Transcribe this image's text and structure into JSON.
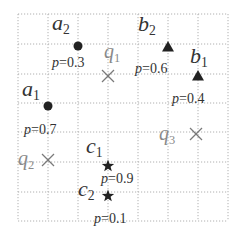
{
  "grid": {
    "x": [
      18,
      48,
      78,
      108,
      138,
      168,
      198,
      228
    ],
    "y": [
      14,
      44,
      74,
      103,
      132,
      162,
      192,
      221
    ],
    "color": "#b0b0b0"
  },
  "points": [
    {
      "id": "a2",
      "letter": "a",
      "sub": "2",
      "shape": "circle",
      "x": 78,
      "y": 46,
      "prob": "p=0.3",
      "label_x": 52,
      "label_y": 30,
      "prob_x": 52,
      "prob_y": 67
    },
    {
      "id": "a1",
      "letter": "a",
      "sub": "1",
      "shape": "circle",
      "x": 48,
      "y": 106,
      "prob": "p=0.7",
      "label_x": 22,
      "label_y": 96,
      "prob_x": 24,
      "prob_y": 134
    },
    {
      "id": "b2",
      "letter": "b",
      "sub": "2",
      "shape": "triangle",
      "x": 168,
      "y": 47,
      "prob": "p=0.6",
      "label_x": 138,
      "label_y": 31,
      "prob_x": 135,
      "prob_y": 73
    },
    {
      "id": "b1",
      "letter": "b",
      "sub": "1",
      "shape": "triangle",
      "x": 198,
      "y": 76,
      "prob": "p=0.4",
      "label_x": 190,
      "label_y": 63,
      "prob_x": 172,
      "prob_y": 103
    },
    {
      "id": "c1",
      "letter": "c",
      "sub": "1",
      "shape": "star",
      "x": 108,
      "y": 166,
      "prob": "p=0.9",
      "label_x": 86,
      "label_y": 153,
      "prob_x": 101,
      "prob_y": 183
    },
    {
      "id": "c2",
      "letter": "c",
      "sub": "2",
      "shape": "star",
      "x": 108,
      "y": 196,
      "prob": "p=0.1",
      "label_x": 78,
      "label_y": 196,
      "prob_x": 94,
      "prob_y": 223
    }
  ],
  "queries": [
    {
      "id": "q1",
      "letter": "q",
      "sub": "1",
      "x": 108,
      "y": 76,
      "label_x": 104,
      "label_y": 58
    },
    {
      "id": "q2",
      "letter": "q",
      "sub": "2",
      "x": 48,
      "y": 160,
      "label_x": 18,
      "label_y": 165
    },
    {
      "id": "q3",
      "letter": "q",
      "sub": "3",
      "x": 196,
      "y": 134,
      "label_x": 159,
      "label_y": 140
    }
  ],
  "colors": {
    "marker": "#222222",
    "query": "#7a7a7a",
    "text": "#333333"
  }
}
